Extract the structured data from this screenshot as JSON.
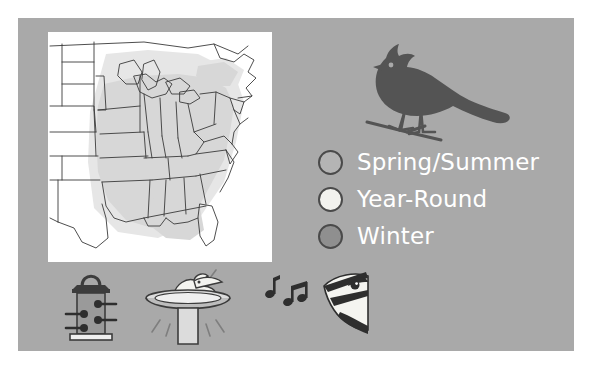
{
  "panel": {
    "background_color": "#a9a9a9",
    "page_background_color": "#ffffff"
  },
  "map": {
    "name": "range-map-eastern-united-states",
    "background_color": "#ffffff",
    "state_fill_shaded": "#d7d7d7",
    "state_fill_unshaded": "#ffffff",
    "outline_color": "#3a3a3a",
    "halo_color": "#e3e3e3"
  },
  "bird": {
    "name": "crested-bird-silhouette",
    "color": "#545454",
    "perch": "branch"
  },
  "legend": {
    "items": [
      {
        "label": "Spring/Summer",
        "swatch_color": "#b4b4b4",
        "outline_color": "#4a4a4a",
        "icon": "circle-swatch-icon"
      },
      {
        "label": "Year-Round",
        "swatch_color": "#f2f2ee",
        "outline_color": "#4a4a4a",
        "icon": "circle-swatch-icon"
      },
      {
        "label": "Winter",
        "swatch_color": "#8f8f8f",
        "outline_color": "#4a4a4a",
        "icon": "circle-swatch-icon"
      }
    ],
    "text_color": "#ffffff"
  },
  "icons": [
    {
      "name": "tube-bird-feeder-icon",
      "label": "Tube Feeder"
    },
    {
      "name": "birdbath-icon",
      "label": "Birdbath"
    },
    {
      "name": "singing-bird-icon",
      "label": "Bird Song"
    }
  ]
}
